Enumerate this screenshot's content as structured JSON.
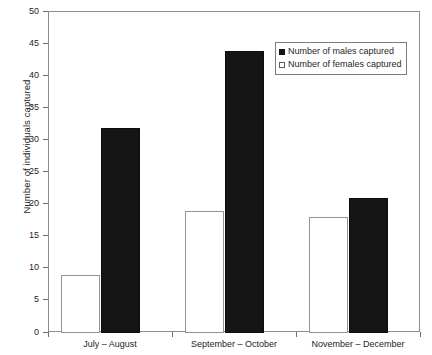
{
  "chart_data": {
    "type": "bar",
    "title": "",
    "xlabel": "",
    "ylabel": "Number of individuals captured",
    "categories": [
      "July – August",
      "September – October",
      "November – December"
    ],
    "series": [
      {
        "name": "Number of females captured",
        "values": [
          9,
          19,
          18
        ],
        "style": "open",
        "color": "#ffffff"
      },
      {
        "name": "Number of males captured",
        "values": [
          32,
          44,
          21
        ],
        "style": "filled",
        "color": "#151515"
      }
    ],
    "ylim": [
      0,
      50
    ],
    "ytick_step": 5,
    "yticks": [
      0,
      5,
      10,
      15,
      20,
      25,
      30,
      35,
      40,
      45,
      50
    ],
    "ytick_labels": [
      "0",
      "5",
      "10",
      "15",
      "20",
      "25",
      "30",
      "35",
      "40",
      "45",
      "50"
    ],
    "grid": false,
    "legend_position": "upper right",
    "legend_entries": [
      "Number of males captured",
      "Number of females captured"
    ]
  }
}
